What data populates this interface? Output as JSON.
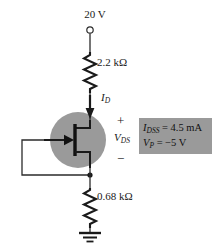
{
  "diagram": {
    "supply": {
      "label": "20 V",
      "terminal": "open-circle-node"
    },
    "resistors": [
      {
        "id": "drain",
        "label": "2.2 kΩ",
        "value": 2.2,
        "unit": "kΩ",
        "position": "drain"
      },
      {
        "id": "source",
        "label": "0.68 kΩ",
        "value": 0.68,
        "unit": "kΩ",
        "position": "source"
      }
    ],
    "current": {
      "symbol": "I",
      "subscript": "D",
      "direction": "down"
    },
    "voltage": {
      "symbol": "V",
      "subscript": "DS",
      "plus": "+",
      "minus": "−"
    },
    "device": {
      "type": "n-channel-jfet",
      "gate_connection": "self-bias-to-source"
    },
    "ground": {
      "symbol": "earth-ground"
    },
    "parameters": {
      "idss": {
        "symbol": "I",
        "subscript": "DSS",
        "equals": "= 4.5 mA"
      },
      "vp": {
        "symbol": "V",
        "subscript": "P",
        "equals": "= −5 V"
      }
    },
    "colors": {
      "wire": "#2b2b2b",
      "device_circle": "#9a9a9a",
      "param_box": "#9a9a9a",
      "text": "#1a1a1a"
    }
  }
}
